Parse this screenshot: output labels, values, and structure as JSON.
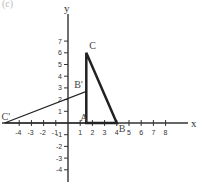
{
  "caption": "(c)",
  "axes": {
    "x_label": "x",
    "y_label": "y",
    "x_ticks": [
      -4,
      -3,
      -2,
      -1,
      1,
      2,
      3,
      4,
      5,
      6,
      7,
      8
    ],
    "y_ticks": [
      7,
      6,
      5,
      4,
      3,
      2,
      1,
      -1,
      -2,
      -3,
      -4
    ]
  },
  "points": {
    "A": {
      "label": "A",
      "x": 1.5,
      "y": 0
    },
    "B": {
      "label": "B",
      "x": 4,
      "y": 0
    },
    "C": {
      "label": "C",
      "x": 1.5,
      "y": 6
    },
    "B_prime": {
      "label": "B'",
      "x": 1.5,
      "y": 2.7
    },
    "C_prime": {
      "label": "C'",
      "x": -5.2,
      "y": 0
    }
  },
  "figures": [
    {
      "name": "triangle-ABC",
      "vertices": [
        "A",
        "B",
        "C"
      ],
      "stroke_width": 2.5
    },
    {
      "name": "triangle-AB'C'",
      "vertices": [
        "A",
        "B_prime",
        "C_prime"
      ],
      "stroke_width": 1.2
    }
  ],
  "colors": {
    "axis": "#333333",
    "lines": "#222222"
  }
}
